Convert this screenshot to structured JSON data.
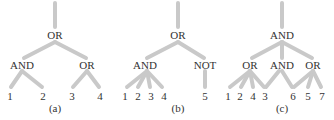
{
  "trees": [
    {
      "caption": "(a)",
      "root": {
        "label": "OR"
      },
      "children": [
        {
          "label": "AND",
          "leaves": [
            "1",
            "2"
          ]
        },
        {
          "label": "OR",
          "leaves": [
            "3",
            "4"
          ]
        }
      ]
    },
    {
      "caption": "(b)",
      "root": {
        "label": "OR"
      },
      "children": [
        {
          "label": "AND",
          "leaves": [
            "1",
            "2",
            "3",
            "4"
          ]
        },
        {
          "label": "NOT",
          "leaves": [
            "5"
          ]
        }
      ]
    },
    {
      "caption": "(c)",
      "root": {
        "label": "AND"
      },
      "children": [
        {
          "label": "OR",
          "leaves": [
            "1",
            "2",
            "4",
            "3"
          ]
        },
        {
          "label": "AND",
          "leaves": [
            "3",
            "6"
          ]
        },
        {
          "label": "OR",
          "leaves": [
            "6",
            "5",
            "7"
          ]
        }
      ],
      "leaf_row": [
        "1",
        "2",
        "4",
        "3",
        "6",
        "5",
        "7"
      ]
    }
  ],
  "colors": {
    "edge": "#c9c9c9",
    "text": "#333333",
    "background": "#ffffff"
  }
}
